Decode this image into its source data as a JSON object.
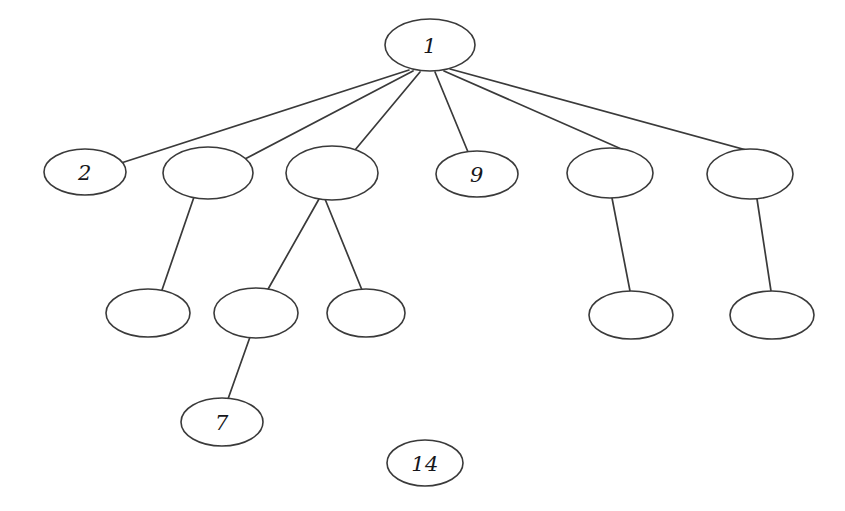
{
  "diagram": {
    "type": "node-link-tree",
    "background_color": "#ffffff",
    "stroke_color": "#3a3a3a",
    "label_color": "#17171b",
    "nodes": [
      {
        "id": "n1",
        "label": "1",
        "cx": 430,
        "cy": 45,
        "rx": 45,
        "ry": 26,
        "labeled": true
      },
      {
        "id": "n2",
        "label": "2",
        "cx": 85,
        "cy": 172,
        "rx": 41,
        "ry": 23,
        "labeled": true
      },
      {
        "id": "n3",
        "label": "",
        "cx": 208,
        "cy": 173,
        "rx": 45,
        "ry": 26,
        "labeled": false
      },
      {
        "id": "n4",
        "label": "",
        "cx": 332,
        "cy": 173,
        "rx": 46,
        "ry": 27,
        "labeled": false
      },
      {
        "id": "n5",
        "label": "9",
        "cx": 477,
        "cy": 174,
        "rx": 41,
        "ry": 23,
        "labeled": true
      },
      {
        "id": "n6",
        "label": "",
        "cx": 610,
        "cy": 173,
        "rx": 43,
        "ry": 25,
        "labeled": false
      },
      {
        "id": "n7",
        "label": "",
        "cx": 750,
        "cy": 174,
        "rx": 43,
        "ry": 25,
        "labeled": false
      },
      {
        "id": "n8",
        "label": "",
        "cx": 148,
        "cy": 313,
        "rx": 42,
        "ry": 24,
        "labeled": false
      },
      {
        "id": "n9",
        "label": "",
        "cx": 256,
        "cy": 313,
        "rx": 42,
        "ry": 25,
        "labeled": false
      },
      {
        "id": "n10",
        "label": "",
        "cx": 366,
        "cy": 313,
        "rx": 39,
        "ry": 24,
        "labeled": false
      },
      {
        "id": "n11",
        "label": "",
        "cx": 631,
        "cy": 315,
        "rx": 42,
        "ry": 24,
        "labeled": false
      },
      {
        "id": "n12",
        "label": "",
        "cx": 772,
        "cy": 315,
        "rx": 42,
        "ry": 24,
        "labeled": false
      },
      {
        "id": "n13",
        "label": "7",
        "cx": 222,
        "cy": 422,
        "rx": 41,
        "ry": 24,
        "labeled": true
      },
      {
        "id": "n14",
        "label": "14",
        "cx": 425,
        "cy": 463,
        "rx": 38,
        "ry": 23,
        "labeled": true
      }
    ],
    "edges": [
      {
        "from": "n1",
        "to": "n2",
        "x1": 409,
        "y1": 70,
        "x2": 118,
        "y2": 164
      },
      {
        "from": "n1",
        "to": "n3",
        "x1": 413,
        "y1": 71,
        "x2": 243,
        "y2": 160
      },
      {
        "from": "n1",
        "to": "n4",
        "x1": 420,
        "y1": 72,
        "x2": 355,
        "y2": 150
      },
      {
        "from": "n1",
        "to": "n5",
        "x1": 435,
        "y1": 72,
        "x2": 468,
        "y2": 152
      },
      {
        "from": "n1",
        "to": "n6",
        "x1": 444,
        "y1": 71,
        "x2": 635,
        "y2": 155
      },
      {
        "from": "n1",
        "to": "n7",
        "x1": 450,
        "y1": 69,
        "x2": 779,
        "y2": 159
      },
      {
        "from": "n3",
        "to": "n8",
        "x1": 194,
        "y1": 197,
        "x2": 162,
        "y2": 290
      },
      {
        "from": "n4",
        "to": "n9",
        "x1": 319,
        "y1": 199,
        "x2": 267,
        "y2": 291
      },
      {
        "from": "n4",
        "to": "n10",
        "x1": 325,
        "y1": 199,
        "x2": 362,
        "y2": 290
      },
      {
        "from": "n6",
        "to": "n11",
        "x1": 612,
        "y1": 198,
        "x2": 630,
        "y2": 291
      },
      {
        "from": "n7",
        "to": "n12",
        "x1": 757,
        "y1": 199,
        "x2": 771,
        "y2": 291
      },
      {
        "from": "n9",
        "to": "n13",
        "x1": 250,
        "y1": 337,
        "x2": 228,
        "y2": 399
      }
    ]
  }
}
